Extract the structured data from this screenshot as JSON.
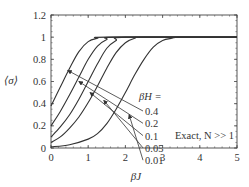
{
  "chart_data": {
    "type": "line",
    "title": "",
    "xlabel": "βJ",
    "ylabel": "⟨σ⟩",
    "xlim": [
      0,
      5
    ],
    "ylim": [
      0,
      1.2
    ],
    "xticks": [
      0,
      1,
      2,
      3,
      4,
      5
    ],
    "yticks": [
      0,
      0.2,
      0.4,
      0.6,
      0.8,
      1,
      1.2
    ],
    "ytick_labels": [
      "0",
      "0.2",
      "0.4",
      "0.6",
      "0.8",
      "1",
      "1.2"
    ],
    "xtick_labels": [
      "0",
      "1",
      "2",
      "3",
      "4",
      "5"
    ],
    "grid": false,
    "legend_header": "βH =",
    "annotation": "Exact, N >> 1",
    "series": [
      {
        "name": "0.4",
        "x": [
          0,
          0.25,
          0.5,
          0.75,
          1,
          1.25,
          1.5,
          5
        ],
        "y": [
          0.38,
          0.55,
          0.72,
          0.87,
          0.96,
          0.99,
          1,
          1
        ]
      },
      {
        "name": "0.2",
        "x": [
          0,
          0.25,
          0.5,
          0.75,
          1,
          1.25,
          1.5,
          1.75,
          5
        ],
        "y": [
          0.2,
          0.33,
          0.48,
          0.64,
          0.8,
          0.92,
          0.98,
          1,
          1
        ]
      },
      {
        "name": "0.1",
        "x": [
          0,
          0.25,
          0.5,
          0.75,
          1,
          1.25,
          1.5,
          1.75,
          2,
          5
        ],
        "y": [
          0.1,
          0.19,
          0.3,
          0.44,
          0.6,
          0.76,
          0.9,
          0.97,
          1,
          1
        ]
      },
      {
        "name": "0.05",
        "x": [
          0,
          0.25,
          0.5,
          0.75,
          1,
          1.25,
          1.5,
          1.75,
          2,
          2.25,
          2.5,
          5
        ],
        "y": [
          0.05,
          0.1,
          0.18,
          0.28,
          0.41,
          0.56,
          0.72,
          0.86,
          0.95,
          0.99,
          1,
          1
        ]
      },
      {
        "name": "0.01",
        "x": [
          0,
          0.5,
          1,
          1.25,
          1.5,
          1.75,
          2,
          2.25,
          2.5,
          2.75,
          3,
          3.25,
          3.5,
          5
        ],
        "y": [
          0.01,
          0.03,
          0.08,
          0.13,
          0.22,
          0.35,
          0.5,
          0.66,
          0.8,
          0.91,
          0.97,
          0.99,
          1,
          1
        ]
      }
    ],
    "legend_labels": [
      {
        "text": "0.4",
        "arrow_to": [
          0.45,
          0.7
        ]
      },
      {
        "text": "0.2",
        "arrow_to": [
          0.75,
          0.6
        ]
      },
      {
        "text": "0.1",
        "arrow_to": [
          1.05,
          0.5
        ]
      },
      {
        "text": "0.05",
        "arrow_to": [
          1.42,
          0.43
        ]
      },
      {
        "text": "0.01",
        "arrow_to": [
          2.1,
          0.3
        ]
      }
    ]
  }
}
